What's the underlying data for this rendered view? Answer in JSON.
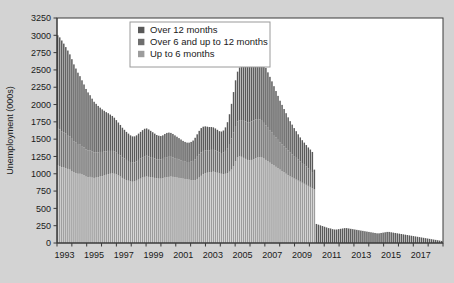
{
  "chart_data": {
    "type": "bar",
    "subtype": "stacked-bar",
    "title": "",
    "xlabel": "",
    "ylabel": "Unemployment (000s)",
    "ylim": [
      0,
      3250
    ],
    "ytick_step": 250,
    "yticks": [
      0,
      250,
      500,
      750,
      1000,
      1250,
      1500,
      1750,
      2000,
      2250,
      2500,
      2750,
      3000,
      3250
    ],
    "xticks": [
      "1993",
      "1995",
      "1997",
      "1999",
      "2001",
      "2003",
      "2005",
      "2007",
      "2009",
      "2011",
      "2013",
      "2015",
      "2017"
    ],
    "x_start_year": 1993,
    "x_end_year": 2018,
    "frequency": "quarterly",
    "grid": false,
    "legend_position": "top-center",
    "colors": {
      "over_12_months": "#595959",
      "over_6_up_to_12_months": "#6e6e6e",
      "up_to_6_months": "#9c9c9c",
      "background": "#d3d3d3",
      "plot_area": "#ffffff",
      "axis": "#3a3a3a",
      "text": "#1a1a1a"
    },
    "series": [
      {
        "name": "Up to 6 months",
        "color": "#9c9c9c",
        "values": [
          1120,
          1110,
          1095,
          1090,
          1080,
          1070,
          1060,
          1040,
          1020,
          1010,
          1000,
          1000,
          990,
          980,
          960,
          950,
          955,
          945,
          940,
          945,
          950,
          960,
          965,
          975,
          985,
          995,
          1000,
          1005,
          1000,
          990,
          975,
          960,
          940,
          925,
          910,
          900,
          890,
          885,
          890,
          900,
          915,
          930,
          945,
          955,
          960,
          955,
          950,
          945,
          940,
          935,
          930,
          930,
          935,
          945,
          950,
          955,
          960,
          955,
          950,
          945,
          940,
          935,
          930,
          925,
          920,
          915,
          910,
          905,
          910,
          925,
          945,
          970,
          995,
          1010,
          1015,
          1020,
          1025,
          1030,
          1025,
          1015,
          1005,
          1000,
          995,
          1000,
          1010,
          1030,
          1060,
          1110,
          1180,
          1235,
          1250,
          1245,
          1230,
          1215,
          1200,
          1195,
          1200,
          1210,
          1225,
          1235,
          1240,
          1235,
          1220,
          1200,
          1180,
          1160,
          1140,
          1120,
          1100,
          1080,
          1060,
          1040,
          1020,
          1000,
          980,
          960,
          945,
          930,
          915,
          900,
          885,
          870,
          855,
          840,
          825,
          810,
          790,
          775
        ]
      },
      {
        "name": "Over 6 and up to 12 months",
        "color": "#6e6e6e",
        "values": [
          540,
          530,
          520,
          510,
          500,
          490,
          480,
          465,
          450,
          440,
          430,
          420,
          410,
          400,
          390,
          385,
          380,
          375,
          370,
          365,
          360,
          355,
          350,
          345,
          340,
          335,
          330,
          325,
          320,
          315,
          310,
          305,
          300,
          295,
          290,
          285,
          280,
          275,
          275,
          280,
          285,
          290,
          295,
          300,
          300,
          295,
          290,
          285,
          280,
          275,
          275,
          275,
          280,
          285,
          290,
          290,
          285,
          280,
          275,
          270,
          265,
          260,
          255,
          250,
          250,
          255,
          265,
          280,
          300,
          320,
          335,
          340,
          335,
          330,
          325,
          320,
          320,
          315,
          310,
          305,
          300,
          300,
          310,
          330,
          360,
          400,
          450,
          490,
          510,
          520,
          525,
          530,
          535,
          540,
          545,
          550,
          555,
          560,
          560,
          555,
          545,
          530,
          515,
          500,
          485,
          470,
          455,
          440,
          425,
          410,
          395,
          385,
          375,
          365,
          355,
          345,
          335,
          325,
          315,
          305,
          295,
          285,
          275,
          265,
          255,
          245,
          235
        ]
      },
      {
        "name": "Over 12 months",
        "color": "#595959",
        "values": [
          1340,
          1330,
          1310,
          1280,
          1250,
          1220,
          1185,
          1150,
          1110,
          1070,
          1030,
          990,
          950,
          910,
          875,
          840,
          800,
          765,
          730,
          700,
          670,
          640,
          615,
          590,
          565,
          545,
          525,
          505,
          490,
          470,
          455,
          440,
          425,
          415,
          405,
          395,
          385,
          380,
          375,
          375,
          380,
          385,
          390,
          395,
          395,
          390,
          380,
          370,
          360,
          350,
          345,
          340,
          340,
          345,
          350,
          350,
          345,
          340,
          330,
          320,
          310,
          300,
          290,
          285,
          280,
          280,
          285,
          295,
          310,
          325,
          340,
          350,
          350,
          345,
          340,
          335,
          330,
          325,
          320,
          315,
          310,
          310,
          320,
          340,
          375,
          430,
          500,
          580,
          660,
          720,
          760,
          790,
          810,
          830,
          850,
          870,
          890,
          900,
          905,
          900,
          890,
          875,
          855,
          830,
          800,
          770,
          740,
          705,
          670,
          635,
          600,
          570,
          540,
          510,
          480,
          455,
          430,
          405,
          385,
          365,
          345,
          330,
          320,
          310,
          300,
          295,
          290,
          285,
          275,
          265,
          255,
          245,
          235,
          225,
          215,
          210,
          200,
          195,
          195,
          200,
          205,
          210,
          215,
          215,
          210,
          205,
          200,
          195,
          190,
          185,
          180,
          175,
          170,
          165,
          160,
          155,
          150,
          145,
          140,
          140,
          145,
          150,
          155,
          160,
          160,
          155,
          150,
          145,
          140,
          135,
          130,
          125,
          120,
          115,
          110,
          105,
          100,
          95,
          90,
          85,
          80,
          75,
          70,
          65,
          60,
          55,
          50,
          45,
          40,
          35,
          30
        ]
      }
    ]
  },
  "legend": {
    "items": [
      {
        "label": "Over 12 months",
        "color": "#595959"
      },
      {
        "label": "Over 6 and up to 12 months",
        "color": "#6e6e6e"
      },
      {
        "label": "Up to 6 months",
        "color": "#9c9c9c"
      }
    ]
  },
  "axes": {
    "y_title": "Unemployment (000s)"
  }
}
